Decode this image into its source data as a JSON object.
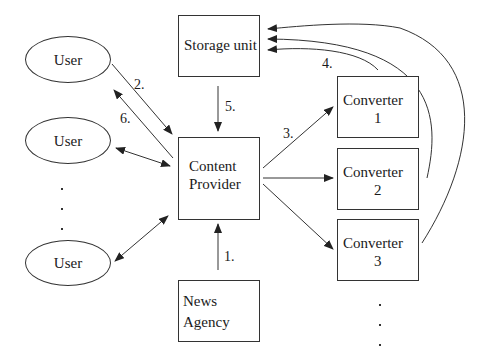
{
  "diagram": {
    "nodes": {
      "storage": {
        "label": "Storage unit"
      },
      "content_provider": {
        "line1": "Content",
        "line2": "Provider"
      },
      "news_agency": {
        "line1": "News",
        "line2": "Agency"
      },
      "converters": [
        {
          "line1": "Converter",
          "line2": "1"
        },
        {
          "line1": "Converter",
          "line2": "2"
        },
        {
          "line1": "Converter",
          "line2": "3"
        }
      ],
      "users": [
        {
          "label": "User"
        },
        {
          "label": "User"
        },
        {
          "label": "User"
        }
      ]
    },
    "steps": {
      "s1": "1.",
      "s2": "2.",
      "s3": "3.",
      "s4": "4.",
      "s5": "5.",
      "s6": "6."
    },
    "edges": [
      {
        "from": "News Agency",
        "to": "Content Provider",
        "label": "1."
      },
      {
        "from": "User",
        "to": "Content Provider",
        "label": "2."
      },
      {
        "from": "Content Provider",
        "to": "Converter 1",
        "label": "3."
      },
      {
        "from": "Content Provider",
        "to": "Converter 2",
        "label": ""
      },
      {
        "from": "Content Provider",
        "to": "Converter 3",
        "label": ""
      },
      {
        "from": "Converter 1",
        "to": "Storage unit",
        "label": "4."
      },
      {
        "from": "Converter 2",
        "to": "Storage unit",
        "label": ""
      },
      {
        "from": "Converter 3",
        "to": "Storage unit",
        "label": ""
      },
      {
        "from": "Storage unit",
        "to": "Content Provider",
        "label": "5."
      },
      {
        "from": "Content Provider",
        "to": "User",
        "label": "6."
      },
      {
        "from": "User",
        "to": "Content Provider",
        "label": "",
        "bidirectional": true
      },
      {
        "from": "User",
        "to": "Content Provider",
        "label": "",
        "bidirectional": true
      }
    ],
    "colors": {
      "stroke": "#333333",
      "background": "#ffffff"
    }
  }
}
